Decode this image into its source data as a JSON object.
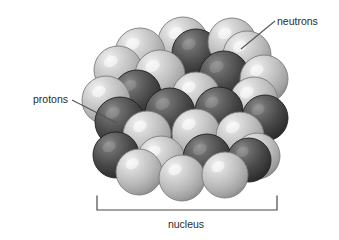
{
  "figure": {
    "background_color": "#ffffff",
    "width": 339,
    "height": 240
  },
  "labels": {
    "neutrons": "neutrons",
    "protons": "protons",
    "nucleus": "nucleus"
  },
  "label_positions": {
    "neutrons": {
      "x": 277,
      "y": 25,
      "anchor": "start"
    },
    "protons": {
      "x": 68,
      "y": 103,
      "anchor": "end"
    },
    "nucleus": {
      "x": 186,
      "y": 228,
      "anchor": "middle"
    }
  },
  "leader_lines": [
    {
      "name": "neutrons-leader",
      "x1": 275,
      "y1": 21,
      "x2": 241,
      "y2": 49
    },
    {
      "name": "protons-leader",
      "x1": 72,
      "y1": 100,
      "x2": 117,
      "y2": 123
    }
  ],
  "bracket": {
    "name": "nucleus-bracket",
    "left_x": 97,
    "right_x": 277,
    "baseline_y": 210,
    "tick_top_y": 196,
    "stroke": "#4a4a4a",
    "stroke_width": 1.2
  },
  "legend_colors": {
    "neutron_light": "#b9b9b9",
    "neutron_highlight": "#f0f0f0",
    "proton_dark": "#3c3c3c",
    "proton_highlight": "#9a9a9a",
    "outline": "#6a6a6a",
    "line_color": "#555555",
    "text_color": "#2b2b2b"
  },
  "particle_counts": {
    "neutrons_visible": 18,
    "protons_visible": 10,
    "total_visible": 28
  },
  "particles": [
    {
      "id": 1,
      "type": "neutron",
      "cx": 183,
      "cy": 42,
      "r": 25
    },
    {
      "id": 2,
      "type": "neutron",
      "cx": 140,
      "cy": 53,
      "r": 25
    },
    {
      "id": 3,
      "type": "proton",
      "cx": 196,
      "cy": 53,
      "r": 24
    },
    {
      "id": 4,
      "type": "neutron",
      "cx": 232,
      "cy": 42,
      "r": 24
    },
    {
      "id": 5,
      "type": "neutron",
      "cx": 118,
      "cy": 70,
      "r": 24
    },
    {
      "id": 6,
      "type": "neutron",
      "cx": 247,
      "cy": 55,
      "r": 24
    },
    {
      "id": 7,
      "type": "neutron",
      "cx": 160,
      "cy": 75,
      "r": 25
    },
    {
      "id": 8,
      "type": "proton",
      "cx": 224,
      "cy": 76,
      "r": 25
    },
    {
      "id": 9,
      "type": "neutron",
      "cx": 264,
      "cy": 79,
      "r": 24
    },
    {
      "id": 10,
      "type": "proton",
      "cx": 137,
      "cy": 94,
      "r": 24
    },
    {
      "id": 11,
      "type": "neutron",
      "cx": 106,
      "cy": 100,
      "r": 24
    },
    {
      "id": 12,
      "type": "neutron",
      "cx": 196,
      "cy": 96,
      "r": 24
    },
    {
      "id": 13,
      "type": "neutron",
      "cx": 254,
      "cy": 101,
      "r": 24
    },
    {
      "id": 14,
      "type": "proton",
      "cx": 170,
      "cy": 113,
      "r": 25
    },
    {
      "id": 15,
      "type": "proton",
      "cx": 120,
      "cy": 122,
      "r": 25
    },
    {
      "id": 16,
      "type": "proton",
      "cx": 219,
      "cy": 111,
      "r": 24
    },
    {
      "id": 17,
      "type": "proton",
      "cx": 265,
      "cy": 118,
      "r": 23
    },
    {
      "id": 18,
      "type": "neutron",
      "cx": 147,
      "cy": 135,
      "r": 24
    },
    {
      "id": 19,
      "type": "neutron",
      "cx": 196,
      "cy": 133,
      "r": 24
    },
    {
      "id": 20,
      "type": "neutron",
      "cx": 240,
      "cy": 136,
      "r": 24
    },
    {
      "id": 21,
      "type": "proton",
      "cx": 116,
      "cy": 155,
      "r": 23
    },
    {
      "id": 22,
      "type": "neutron",
      "cx": 161,
      "cy": 160,
      "r": 24
    },
    {
      "id": 23,
      "type": "proton",
      "cx": 207,
      "cy": 158,
      "r": 24
    },
    {
      "id": 24,
      "type": "neutron",
      "cx": 257,
      "cy": 156,
      "r": 23
    },
    {
      "id": 25,
      "type": "proton",
      "cx": 249,
      "cy": 160,
      "r": 22
    },
    {
      "id": 26,
      "type": "neutron",
      "cx": 139,
      "cy": 172,
      "r": 23
    },
    {
      "id": 27,
      "type": "neutron",
      "cx": 182,
      "cy": 178,
      "r": 23
    },
    {
      "id": 28,
      "type": "neutron",
      "cx": 225,
      "cy": 175,
      "r": 23
    }
  ]
}
